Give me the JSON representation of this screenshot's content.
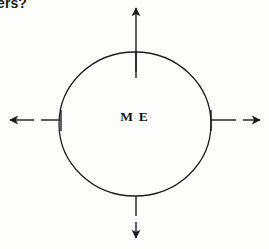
{
  "page": {
    "width": 269,
    "height": 249,
    "background_color": "#fdfdfc",
    "ink_color": "#1b1b20"
  },
  "clipped_text": {
    "value": "ers?",
    "note": "partially cropped text at top-left corner"
  },
  "diagram": {
    "type": "radial-mind-map",
    "center_node": {
      "label": "M E",
      "shape": "ellipse",
      "cx": 135,
      "cy": 124,
      "rx": 76,
      "ry": 72,
      "stroke_color": "#1b1b20",
      "stroke_width": 1.3,
      "fill": "none"
    },
    "branches": [
      {
        "name": "branch-up",
        "direction": "up",
        "label": "",
        "stub": {
          "x1": 136,
          "y1": 52,
          "x2": 136,
          "y2": 72
        },
        "shaft": {
          "x1": 136,
          "y1": 78,
          "x2": 136,
          "y2": 6
        },
        "arrow_tip": {
          "x": 136,
          "y": 2
        }
      },
      {
        "name": "branch-right",
        "direction": "right",
        "label": "",
        "stub": {
          "x1": 211,
          "y1": 120,
          "x2": 236,
          "y2": 120
        },
        "shaft": {
          "x1": 243,
          "y1": 120,
          "x2": 262,
          "y2": 120
        },
        "arrow_tip": {
          "x": 266,
          "y": 120
        }
      },
      {
        "name": "branch-down",
        "direction": "down",
        "label": "",
        "stub": {
          "x1": 136,
          "y1": 196,
          "x2": 136,
          "y2": 216
        },
        "shaft": {
          "x1": 136,
          "y1": 222,
          "x2": 136,
          "y2": 239
        },
        "arrow_tip": {
          "x": 136,
          "y": 244
        }
      },
      {
        "name": "branch-left",
        "direction": "left",
        "label": "",
        "stub": {
          "x1": 60,
          "y1": 120,
          "x2": 41,
          "y2": 120
        },
        "shaft": {
          "x1": 34,
          "y1": 120,
          "x2": 9,
          "y2": 120
        },
        "arrow_tip": {
          "x": 4,
          "y": 120
        }
      }
    ],
    "connector_ticks": [
      {
        "name": "tick-left",
        "x": 61,
        "y1": 110,
        "y2": 131
      },
      {
        "name": "tick-right",
        "x": 211,
        "y1": 110,
        "y2": 131
      }
    ]
  }
}
